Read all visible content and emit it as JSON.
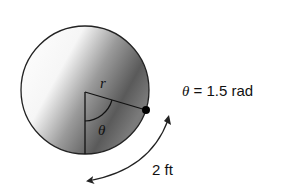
{
  "diagram": {
    "labels": {
      "radius": "r",
      "angle": "θ",
      "angle_equation_symbol": "θ",
      "angle_equation_value": " = 1.5 rad",
      "arc_length": "2 ft"
    },
    "values": {
      "theta_rad": 1.5,
      "arc_length_ft": 2
    },
    "colors": {
      "stroke": "#222222",
      "shade_dark": "#4a4a4a",
      "shade_light": "#ffffff"
    }
  }
}
